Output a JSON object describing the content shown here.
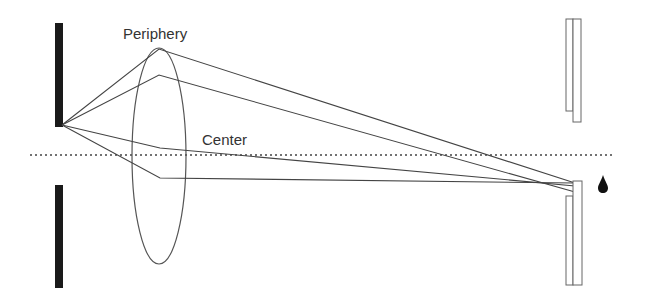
{
  "diagram": {
    "title": "",
    "labels": {
      "periphery": "Periphery",
      "center": "Center"
    },
    "elements": {
      "left_aperture": [
        "top-bar",
        "bottom-bar"
      ],
      "lens": "ellipse lens",
      "optical_axis": "dotted line",
      "image_plane_upper": "double rectangle (upper)",
      "image_plane_lower": "double rectangle (lower)",
      "drop": "drop icon"
    },
    "colors": {
      "line": "#444444",
      "bar": "#1a1a1a"
    }
  }
}
